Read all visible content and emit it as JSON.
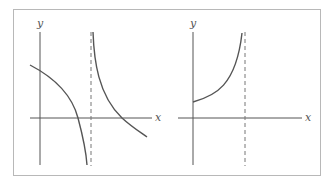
{
  "figure": {
    "panels": [
      {
        "id": "left",
        "x_label": "x",
        "y_label": "y",
        "description": "Decreasing curve crossing y-axis, falling to vertical asymptote; second branch descending from asymptote crossing x-axis",
        "asymptote": "vertical dashed line"
      },
      {
        "id": "right",
        "x_label": "x",
        "y_label": "y",
        "description": "Increasing curve starting on positive y-axis, rising toward vertical asymptote",
        "asymptote": "vertical dashed line"
      }
    ],
    "colors": {
      "axis": "#555555",
      "curve": "#555555",
      "border": "#b8b8b8",
      "dashed": "#777777"
    }
  }
}
